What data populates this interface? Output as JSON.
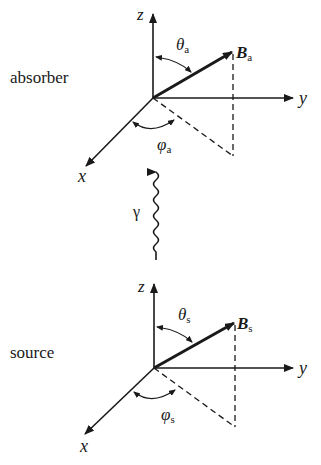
{
  "figure": {
    "panels": [
      {
        "id": "absorber",
        "label": "absorber",
        "axes": {
          "z": "z",
          "y": "y",
          "x": "x"
        },
        "vector": {
          "symbol": "B",
          "subscript": "a"
        },
        "polar_angle": {
          "symbol": "θ",
          "subscript": "a"
        },
        "azimuth_angle": {
          "symbol": "φ",
          "subscript": "a"
        }
      },
      {
        "id": "source",
        "label": "source",
        "axes": {
          "z": "z",
          "y": "y",
          "x": "x"
        },
        "vector": {
          "symbol": "B",
          "subscript": "s"
        },
        "polar_angle": {
          "symbol": "θ",
          "subscript": "s"
        },
        "azimuth_angle": {
          "symbol": "φ",
          "subscript": "s"
        }
      }
    ],
    "photon": {
      "symbol": "γ"
    },
    "colors": {
      "ink": "#1a1a1a",
      "background": "#ffffff"
    }
  }
}
